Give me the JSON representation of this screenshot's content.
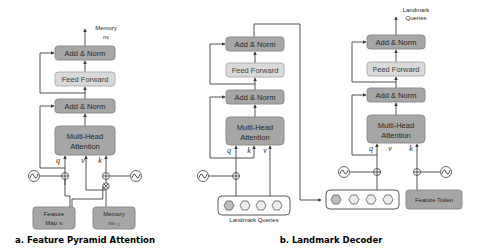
{
  "panel_a": {
    "caption": "a. Feature Pyramid Attention",
    "output_label_line1": "Memory",
    "output_label_line2": "mᵢ",
    "blocks": {
      "add_norm_top": "Add & Norm",
      "feed_forward": "Feed Forward",
      "add_norm_bottom": "Add & Norm",
      "mha_line1": "Multi-Head",
      "mha_line2": "Attention"
    },
    "inputs": {
      "feature_map_line1": "Feature",
      "feature_map_line2": "Map xᵢ",
      "memory_line1": "Memory",
      "memory_line2": "mᵢ₋₁"
    },
    "qkv": {
      "q": "q",
      "v": "v",
      "k": "k"
    }
  },
  "panel_b": {
    "caption": "b. Landmark Decoder",
    "output_label_line1": "Landmark",
    "output_label_line2": "Queries",
    "left_block": {
      "add_norm_top": "Add & Norm",
      "feed_forward": "Feed Forward",
      "add_norm_bottom": "Add & Norm",
      "mha_line1": "Multi-Head",
      "mha_line2": "Attention",
      "qkv": {
        "q": "q",
        "k": "k",
        "v": "v"
      }
    },
    "right_block": {
      "add_norm_top": "Add & Norm",
      "feed_forward": "Feed Forward",
      "add_norm_bottom": "Add & Norm",
      "mha_line1": "Multi-Head",
      "mha_line2": "Attention",
      "qkv": {
        "q": "q",
        "v": "v",
        "k": "k"
      }
    },
    "landmark_queries_label": "Landmark Queries",
    "feature_token_label": "Feature Token"
  },
  "colors": {
    "dark_block": "#a6a6a6",
    "light_block": "#d9d9d9",
    "line": "#404040"
  }
}
